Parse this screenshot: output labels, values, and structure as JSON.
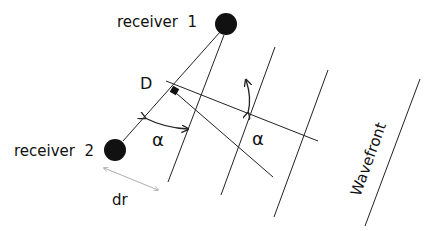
{
  "diagram": {
    "labels": {
      "receiver1": "receiver  1",
      "receiver2": "receiver  2",
      "point_d": "D",
      "alpha_left": "α",
      "alpha_right": "α",
      "dr": "dr",
      "wavefront": "Wavefront"
    },
    "colors": {
      "line": "#222222",
      "receiver": "#111111",
      "dr_arrow": "#999999",
      "background": "#ffffff"
    },
    "elements": {
      "receivers": 2,
      "wavefront_lines": 4
    }
  }
}
